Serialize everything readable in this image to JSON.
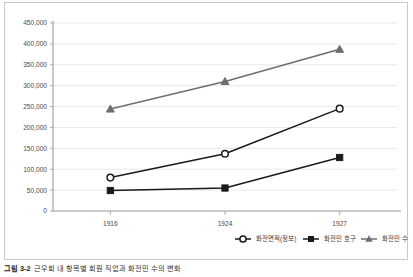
{
  "chart_data": {
    "type": "line",
    "title": "",
    "xlabel": "",
    "ylabel": "",
    "categories": [
      "1916",
      "1924",
      "1927"
    ],
    "ylim": [
      0,
      450000
    ],
    "ytick_labels": [
      "450,000",
      "400,000",
      "350,000",
      "300,000",
      "250,000",
      "200,000",
      "150,000",
      "100,000",
      "50,000",
      "0"
    ],
    "ytick_values": [
      450000,
      400000,
      350000,
      300000,
      250000,
      200000,
      150000,
      100000,
      50000,
      0
    ],
    "grid": true,
    "legend_position": "bottom",
    "series": [
      {
        "name": "화전면적(정보)",
        "marker": "open-circle",
        "color": "#1a1a1a",
        "values": [
          80000,
          137000,
          245000
        ]
      },
      {
        "name": "화전민 호구",
        "marker": "filled-square",
        "color": "#1a1a1a",
        "values": [
          49000,
          55000,
          128000
        ]
      },
      {
        "name": "화전민 수",
        "marker": "filled-triangle",
        "color": "#6e6e6e",
        "values": [
          244000,
          310000,
          387000
        ]
      }
    ]
  },
  "legend": {
    "items": [
      {
        "label": "화전면적(정보)",
        "marker": "open-circle"
      },
      {
        "label": "화전민 호구",
        "marker": "filled-square"
      },
      {
        "label": "화전민 수",
        "marker": "filled-triangle"
      }
    ]
  },
  "caption": {
    "number": "그림 3-2",
    "text": "근우회 내 항목별 회원 직업과 화전민 수의 변화"
  },
  "colors": {
    "series_dark": "#1a1a1a",
    "series_gray": "#6e6e6e",
    "grid": "#e2e2e2",
    "axis": "#9a9a9a",
    "frame": "#c8c8c8",
    "tick_text": "#4a4a4a"
  }
}
